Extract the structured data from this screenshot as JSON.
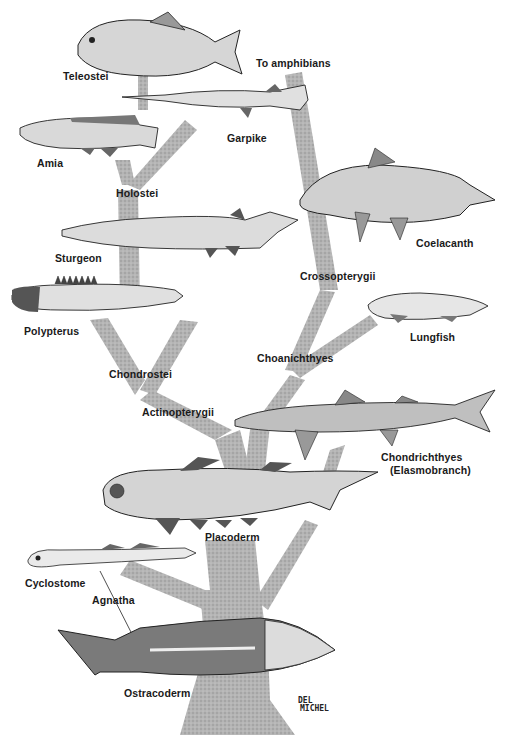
{
  "diagram": {
    "type": "phylogenetic tree illustration",
    "colors": {
      "background": "#ffffff",
      "branch_stipple": "#a8a8a8",
      "ink": "#1a1a1a",
      "fish_body": "#d9d9d9",
      "fish_dark": "#555555"
    },
    "labels": {
      "teleostei": "Teleostei",
      "to_amphibians": "To amphibians",
      "garpike": "Garpike",
      "amia": "Amia",
      "holostei": "Holostei",
      "coelacanth": "Coelacanth",
      "sturgeon": "Sturgeon",
      "crossopterygii": "Crossopterygii",
      "polypterus": "Polypterus",
      "lungfish": "Lungfish",
      "choanichthyes": "Choanichthyes",
      "chondrostei": "Chondrostei",
      "actinopterygii": "Actinopterygii",
      "chondrichthyes": "Chondrichthyes",
      "elasmobranch": "(Elasmobranch)",
      "placoderm": "Placoderm",
      "cyclostome": "Cyclostome",
      "agnatha": "Agnatha",
      "ostracoderm": "Ostracoderm"
    },
    "signature": {
      "line1": "DEL",
      "line2": "MICHEL"
    },
    "tree": {
      "root": "Ostracoderm / Agnatha",
      "branches": [
        {
          "name": "Agnatha",
          "children": [
            "Cyclostome",
            "Ostracoderm"
          ]
        },
        {
          "name": "Placoderm",
          "children": [
            "Chondrichthyes",
            "Actinopterygii",
            "Choanichthyes"
          ]
        },
        {
          "name": "Actinopterygii",
          "children": [
            "Chondrostei",
            "Holostei",
            "Teleostei"
          ]
        },
        {
          "name": "Chondrostei",
          "children": [
            "Polypterus",
            "Sturgeon"
          ]
        },
        {
          "name": "Holostei",
          "children": [
            "Amia",
            "Garpike"
          ]
        },
        {
          "name": "Choanichthyes",
          "children": [
            "Lungfish",
            "Crossopterygii"
          ]
        },
        {
          "name": "Crossopterygii",
          "children": [
            "Coelacanth",
            "To amphibians"
          ]
        }
      ]
    }
  }
}
